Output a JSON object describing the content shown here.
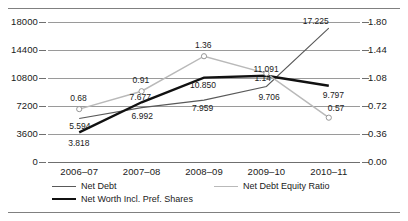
{
  "chart_data": {
    "type": "line",
    "title": "",
    "xlabel": "",
    "ylabel": "",
    "categories": [
      "2006–07",
      "2007–08",
      "2008–09",
      "2009–10",
      "2010–11"
    ],
    "grid": true,
    "legend_position": "bottom",
    "axes": {
      "left": {
        "ylim": [
          0,
          18000
        ],
        "ticks": [
          "0",
          "3600",
          "7200",
          "10800",
          "14400",
          "18000"
        ],
        "tick_values": [
          0,
          3600,
          7200,
          10800,
          14400,
          18000
        ]
      },
      "right": {
        "ylim": [
          0.0,
          1.8
        ],
        "ticks": [
          "0.00",
          "0.36",
          "0.72",
          "1.08",
          "1.44",
          "1.80"
        ],
        "tick_values": [
          0.0,
          0.36,
          0.72,
          1.08,
          1.44,
          1.8
        ]
      }
    },
    "series": [
      {
        "name": "Net Debt",
        "axis": "left",
        "color": "#595959",
        "values": [
          5594,
          6992,
          7959,
          9706,
          17225
        ],
        "labels": [
          "5.594",
          "6.992",
          "7.959",
          "9.706",
          "17.225"
        ]
      },
      {
        "name": "Net Worth Incl. Pref. Shares",
        "axis": "left",
        "color": "#111111",
        "values": [
          3818,
          7677,
          10850,
          11091,
          9797
        ],
        "labels": [
          "3.818",
          "7.677",
          "10.850",
          "11.091",
          "9.797"
        ]
      },
      {
        "name": "Net Debt Equity Ratio",
        "axis": "right",
        "color": "#b9b9b9",
        "marker": "circle-open",
        "values": [
          0.68,
          0.91,
          1.36,
          1.14,
          0.57
        ],
        "labels": [
          "0.68",
          "0.91",
          "1.36",
          "1.14",
          "0.57"
        ]
      }
    ]
  },
  "legend": {
    "items": [
      {
        "label": "Net Debt"
      },
      {
        "label": "Net Debt Equity Ratio"
      },
      {
        "label": "Net Worth Incl. Pref. Shares"
      }
    ]
  }
}
